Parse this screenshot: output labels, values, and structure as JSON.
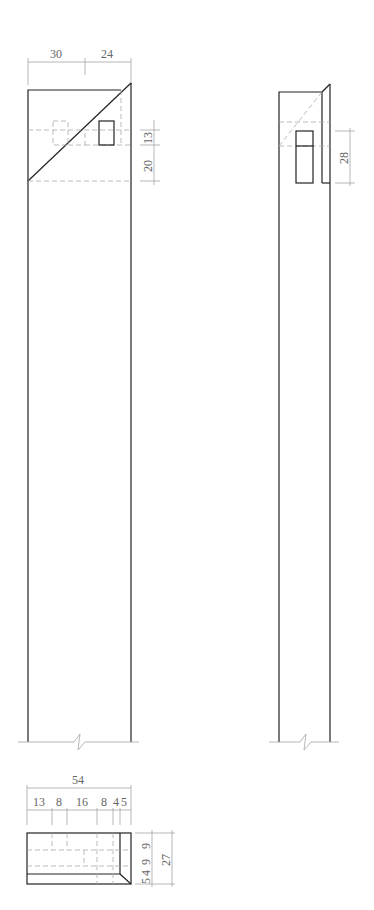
{
  "front_view": {
    "dims_top": [
      "30",
      "24"
    ],
    "dims_right": [
      "13",
      "20"
    ]
  },
  "side_view": {
    "dims_right": [
      "28"
    ]
  },
  "top_view": {
    "dim_overall": "54",
    "dims_top": [
      "13",
      "8",
      "16",
      "8",
      "4",
      "5"
    ],
    "dims_right_inner": [
      "9",
      "9",
      "4",
      "5"
    ],
    "dim_right_overall": "27"
  }
}
